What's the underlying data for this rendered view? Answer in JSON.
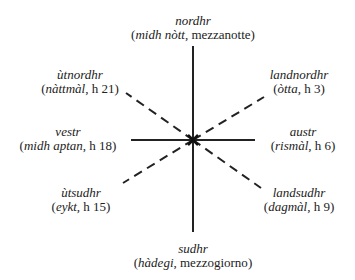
{
  "diagram": {
    "type": "compass-rose-time-of-day",
    "directions": [
      {
        "id": "n",
        "name": "nordhr",
        "term": "midh nòtt",
        "rest": ", mezzanotte"
      },
      {
        "id": "ne",
        "name": "landnordhr",
        "term": "òtta",
        "rest": ", h 3"
      },
      {
        "id": "e",
        "name": "austr",
        "term": "rismàl",
        "rest": ", h 6"
      },
      {
        "id": "se",
        "name": "landsudhr",
        "term": "dagmàl",
        "rest": ", h 9"
      },
      {
        "id": "s",
        "name": "sudhr",
        "term": "hàdegi",
        "rest": ", mezzogiorno"
      },
      {
        "id": "sw",
        "name": "ùtsudhr",
        "term": "eykt",
        "rest": ", h 15"
      },
      {
        "id": "w",
        "name": "vestr",
        "term": "midh aptan",
        "rest": ", h 18"
      },
      {
        "id": "nw",
        "name": "ùtnordhr",
        "term": "nàttmàl",
        "rest": ", h 21"
      }
    ],
    "paren_open": "(",
    "paren_close": ")",
    "line_color": "#222222"
  }
}
